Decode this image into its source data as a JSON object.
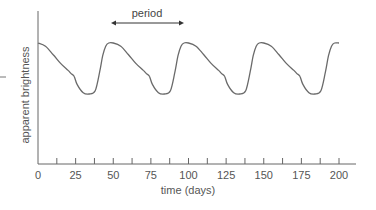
{
  "chart_data": {
    "type": "line",
    "title": "",
    "xlabel": "time (days)",
    "ylabel": "apparent brightness",
    "xlim": [
      0,
      210
    ],
    "ylim": [
      0,
      1.3
    ],
    "xticks": [
      0,
      25,
      50,
      75,
      100,
      125,
      150,
      175,
      200
    ],
    "minor_xticks": [
      12.5,
      37.5,
      62.5,
      87.5,
      112.5,
      137.5,
      162.5,
      187.5
    ],
    "yticks": [],
    "grid": false,
    "legend": null,
    "annotation": {
      "text": "period",
      "x_start": 49,
      "x_end": 96,
      "type": "double-arrow"
    },
    "series": [
      {
        "name": "Cepheid light curve",
        "color": "#6a6a6a",
        "x": [
          0,
          5,
          10,
          15,
          20,
          22,
          24,
          26,
          30,
          34,
          38,
          41,
          43,
          45,
          47,
          50,
          55,
          60,
          65,
          70,
          72,
          74,
          76,
          80,
          84,
          88,
          91,
          93,
          95,
          97,
          100,
          105,
          110,
          115,
          120,
          122,
          124,
          126,
          130,
          134,
          138,
          141,
          143,
          145,
          147,
          150,
          155,
          160,
          165,
          170,
          172,
          174,
          176,
          180,
          184,
          188,
          191,
          193,
          195,
          197,
          200
        ],
        "y": [
          1.0,
          0.95,
          0.82,
          0.68,
          0.57,
          0.52,
          0.48,
          0.35,
          0.22,
          0.2,
          0.25,
          0.55,
          0.8,
          0.95,
          1.0,
          1.0,
          0.95,
          0.82,
          0.68,
          0.57,
          0.52,
          0.48,
          0.35,
          0.22,
          0.2,
          0.25,
          0.55,
          0.8,
          0.95,
          1.0,
          1.0,
          0.95,
          0.82,
          0.68,
          0.57,
          0.52,
          0.48,
          0.35,
          0.22,
          0.2,
          0.25,
          0.55,
          0.8,
          0.95,
          1.0,
          1.0,
          0.95,
          0.82,
          0.68,
          0.57,
          0.52,
          0.48,
          0.35,
          0.22,
          0.2,
          0.25,
          0.55,
          0.8,
          0.95,
          1.0,
          1.0
        ]
      }
    ]
  },
  "labels": {
    "period": "period",
    "xlabel": "time (days)",
    "ylabel": "apparent brightness",
    "ticks": [
      "0",
      "25",
      "50",
      "75",
      "100",
      "125",
      "150",
      "175",
      "200"
    ]
  }
}
